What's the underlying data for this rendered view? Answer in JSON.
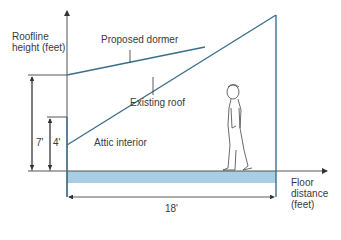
{
  "labels": {
    "y_axis": [
      "Roofline",
      "height (feet)"
    ],
    "proposed_dormer": "Proposed dormer",
    "existing_roof": "Existing roof",
    "attic_interior": "Attic interior",
    "x_axis": [
      "Floor",
      "distance",
      "(feet)"
    ],
    "dim_7": "7'",
    "dim_4": "4'",
    "dim_18": "18'"
  },
  "colors": {
    "roof_line": "#3a6f8c",
    "floor_band": "#a9cde3",
    "axis": "#555555",
    "text": "#3a3a3a"
  },
  "geometry": {
    "wall_height_dormer_ft": 7,
    "wall_height_existing_ft": 4,
    "floor_length_ft": 18
  }
}
